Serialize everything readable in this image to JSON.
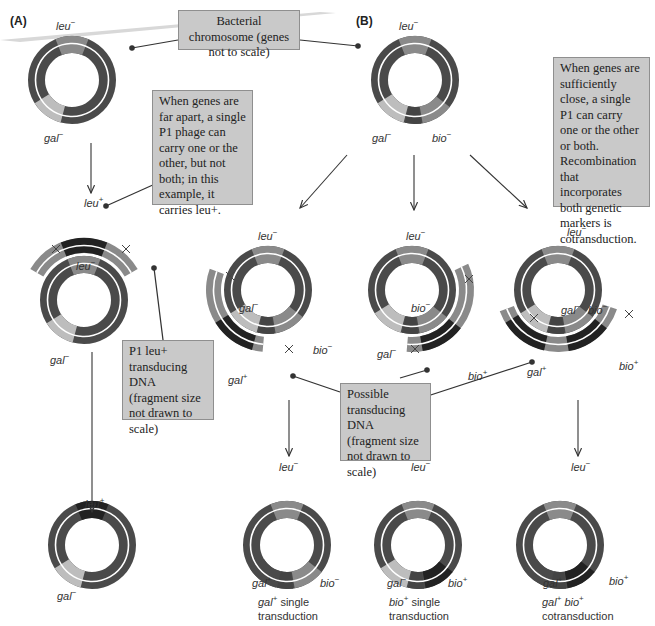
{
  "panels": {
    "a_label": "(A)",
    "b_label": "(B)"
  },
  "colors": {
    "chromosome_dark": "#4a4a4a",
    "leu_minus": "#8a8a8a",
    "gal_minus": "#bdbdbd",
    "bio_minus": "#8a8a8a",
    "plus_allele": "#222222",
    "connector_dark": "#444444",
    "callout_bg": "#c9c9c9"
  },
  "callouts": {
    "chromosome": "Bacterial chromosome (genes not to scale)",
    "far_apart": "When genes are far apart, a single P1 phage can carry one or the other, but not both; in this example, it carries leu+.",
    "close": "When genes are sufficiently close, a single P1 can carry one or the other or both. Recombination that incorporates both genetic markers is cotransduction.",
    "p1_leu": "P1 leu+ transducing DNA (fragment size not drawn to scale)",
    "possible": "Possible transducing DNA (fragment size not drawn to scale)"
  },
  "labels": {
    "a_top_leu": "leu",
    "a_top_leu_sup": "−",
    "a_top_gal": "gal",
    "a_top_gal_sup": "−",
    "a_mid_fragment_leu": "leu",
    "a_mid_fragment_leu_sup": "+",
    "a_mid_leu": "leu",
    "a_mid_leu_sup": "−",
    "a_mid_gal": "gal",
    "a_mid_gal_sup": "−",
    "a_bot_leu": "leu",
    "a_bot_leu_sup": "+",
    "a_bot_gal": "gal",
    "a_bot_gal_sup": "−",
    "b_top_leu": "leu",
    "b_top_leu_sup": "−",
    "b_top_gal": "gal",
    "b_top_gal_sup": "−",
    "b_top_bio": "bio",
    "b_top_bio_sup": "−",
    "b1_mid_leu": "leu",
    "b1_mid_leu_sup": "−",
    "b1_mid_gal": "gal",
    "b1_mid_gal_sup": "−",
    "b1_mid_bio": "bio",
    "b1_mid_bio_sup": "−",
    "b1_mid_frag_gal": "gal",
    "b1_mid_frag_gal_sup": "+",
    "b2_mid_leu": "leu",
    "b2_mid_leu_sup": "−",
    "b2_mid_gal": "gal",
    "b2_mid_gal_sup": "−",
    "b2_mid_bio": "bio",
    "b2_mid_bio_sup": "−",
    "b2_mid_frag_bio": "bio",
    "b2_mid_frag_bio_sup": "+",
    "b3_mid_leu": "leu",
    "b3_mid_leu_sup": "−",
    "b3_mid_galbio": "gal",
    "b3_mid_galbio_sup": "−",
    "b3_mid_bio2": "bio",
    "b3_mid_bio2_sup": "−",
    "b3_mid_frag_gal": "gal",
    "b3_mid_frag_gal_sup": "+",
    "b3_mid_frag_bio": "bio",
    "b3_mid_frag_bio_sup": "+",
    "b1_bot_leu": "leu",
    "b1_bot_leu_sup": "−",
    "b1_bot_gal": "gal",
    "b1_bot_gal_sup": "+",
    "b1_bot_bio": "bio",
    "b1_bot_bio_sup": "−",
    "b2_bot_leu": "leu",
    "b2_bot_leu_sup": "−",
    "b2_bot_gal": "gal",
    "b2_bot_gal_sup": "−",
    "b2_bot_bio": "bio",
    "b2_bot_bio_sup": "+",
    "b3_bot_leu": "leu",
    "b3_bot_leu_sup": "−",
    "b3_bot_gal": "gal",
    "b3_bot_gal_sup": "+",
    "b3_bot_bio": "bio",
    "b3_bot_bio_sup": "+"
  },
  "captions": {
    "b1": {
      "gene": "gal",
      "sup": "+",
      "line1_rest": " single",
      "line2": "transduction"
    },
    "b2": {
      "gene": "bio",
      "sup": "+",
      "line1_rest": " single",
      "line2": "transduction"
    },
    "b3": {
      "gene1": "gal",
      "sup1": "+",
      "gene2": "bio",
      "sup2": "+",
      "line2": "cotransduction"
    }
  },
  "crossover_symbol": "×"
}
